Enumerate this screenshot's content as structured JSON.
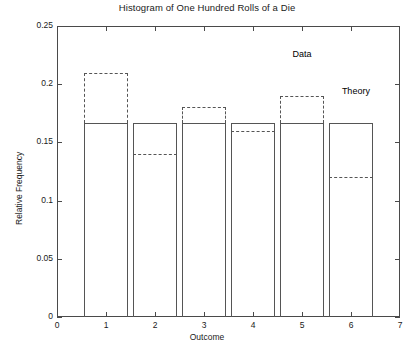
{
  "chart_data": {
    "type": "bar",
    "title": "Histogram of One Hundred Rolls of a Die",
    "xlabel": "Outcome",
    "ylabel": "Relative Frequency",
    "categories": [
      "1",
      "2",
      "3",
      "4",
      "5",
      "6"
    ],
    "xlim": [
      0,
      7
    ],
    "ylim": [
      0,
      0.25
    ],
    "xticks": [
      "0",
      "1",
      "2",
      "3",
      "4",
      "5",
      "6",
      "7"
    ],
    "xtick_values": [
      0,
      1,
      2,
      3,
      4,
      5,
      6,
      7
    ],
    "yticks": [
      "0",
      "0.05",
      "0.1",
      "0.15",
      "0.2",
      "0.25"
    ],
    "ytick_values": [
      0,
      0.05,
      0.1,
      0.15,
      0.2,
      0.25
    ],
    "grid": false,
    "legend_position": "inline-annotation",
    "series": [
      {
        "name": "Theory",
        "style": "solid-bar",
        "values": [
          0.1667,
          0.1667,
          0.1667,
          0.1667,
          0.1667,
          0.1667
        ]
      },
      {
        "name": "Data",
        "style": "dashed-outline",
        "values": [
          0.21,
          0.14,
          0.18,
          0.16,
          0.19,
          0.12
        ]
      }
    ],
    "annotations": [
      {
        "text": "Data",
        "x": 5.0,
        "y": 0.2255
      },
      {
        "text": "Theory",
        "x": 6.1,
        "y": 0.1935
      }
    ]
  }
}
